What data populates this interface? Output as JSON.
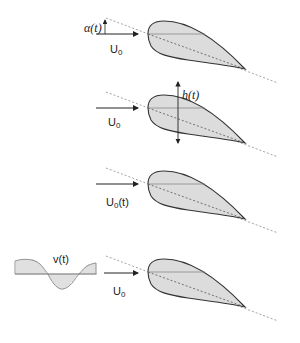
{
  "diagram": {
    "colors": {
      "airfoil_fill": "#dcdcdc",
      "airfoil_stroke": "#333333",
      "arrow": "#222222",
      "dotted": "#8a8a8a",
      "wave_fill": "#9a9a9a"
    },
    "panels": [
      {
        "id": "pitching",
        "labels": {
          "angle": "α(t)",
          "velocity_main": "U",
          "velocity_sub": "0",
          "velocity_suffix": ""
        }
      },
      {
        "id": "plunging",
        "labels": {
          "displacement": "h(t)",
          "velocity_main": "U",
          "velocity_sub": "0",
          "velocity_suffix": ""
        }
      },
      {
        "id": "surging",
        "labels": {
          "velocity_main": "U",
          "velocity_sub": "0",
          "velocity_suffix": "(t)"
        }
      },
      {
        "id": "gust",
        "labels": {
          "gust": "v(t)",
          "velocity_main": "U",
          "velocity_sub": "0",
          "velocity_suffix": ""
        }
      }
    ]
  }
}
